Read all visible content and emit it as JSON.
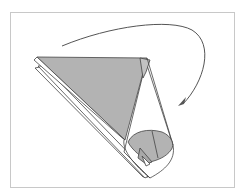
{
  "diagram": {
    "type": "origami-folding-step",
    "colors": {
      "paper_colored": "#b3b3b3",
      "paper_white": "#ffffff",
      "line": "#444444",
      "frame": "#c8c8c8",
      "arrow": "#555555"
    },
    "elements": [
      {
        "name": "frame"
      },
      {
        "name": "fold-arrow",
        "direction": "clockwise"
      },
      {
        "name": "paper-cone"
      }
    ]
  }
}
